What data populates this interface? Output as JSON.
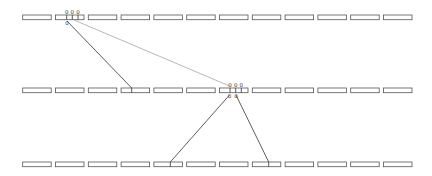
{
  "diagram": {
    "type": "tree-of-arrays",
    "rows": [
      {
        "id": "row-top",
        "y": 15,
        "box_count": 12
      },
      {
        "id": "row-middle",
        "y": 88,
        "box_count": 12
      },
      {
        "id": "row-bottom",
        "y": 162,
        "box_count": 12
      }
    ],
    "box": {
      "start_x": 22.7,
      "pitch": 32.8,
      "width": 28.5,
      "height": 4.7
    },
    "nodes": [
      {
        "id": "node-top",
        "row": 0,
        "box_index": 1,
        "divider_x": [
          66.7,
          72.3,
          78
        ],
        "top_labels": [
          "0",
          "0",
          "0"
        ],
        "bottom_labels": [
          {
            "x": 67,
            "text": "0"
          }
        ]
      },
      {
        "id": "node-middle",
        "row": 1,
        "box_index": 6,
        "divider_x": [
          230,
          235.7,
          241.3
        ],
        "top_labels": [
          "0",
          "0",
          "0"
        ],
        "bottom_labels": [
          {
            "x": 229.5,
            "text": "0"
          },
          {
            "x": 236,
            "text": "0"
          }
        ]
      }
    ],
    "edges": [
      {
        "from": "node-top",
        "to": "row-middle box 4",
        "x1": 67,
        "y1": 21,
        "x2": 131.7,
        "y2": 88,
        "style": "solid"
      },
      {
        "from": "node-top",
        "to": "node-middle",
        "x1": 74,
        "y1": 20,
        "x2": 229.5,
        "y2": 86,
        "style": "thin"
      },
      {
        "from": "node-middle",
        "to": "row-bottom box 5",
        "x1": 229.5,
        "y1": 95,
        "x2": 170.3,
        "y2": 162,
        "style": "solid"
      },
      {
        "from": "node-middle",
        "to": "row-bottom box 8",
        "x1": 236,
        "y1": 95,
        "x2": 268.7,
        "y2": 162,
        "style": "solid"
      }
    ],
    "colors": {
      "box_stroke": "#555555",
      "edge": "#333333",
      "edge_thin": "#999999",
      "background": "#ffffff"
    }
  }
}
